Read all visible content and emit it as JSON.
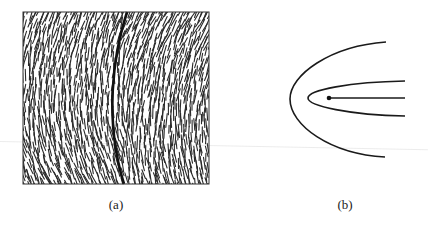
{
  "figure": {
    "panels": [
      {
        "id": "a",
        "caption": "(a)",
        "description": "Square frame filled with short hatched line segments (director field) with a thick dark curved line (defect wall) running top to bottom"
      },
      {
        "id": "b",
        "caption": "(b)",
        "description": "Two nested parabolic curves opening to the right with a dot at the focus and a horizontal line extending right from the dot"
      }
    ]
  },
  "colors": {
    "ink": "#1a1a1a",
    "background": "#ffffff",
    "frame": "#333333"
  }
}
